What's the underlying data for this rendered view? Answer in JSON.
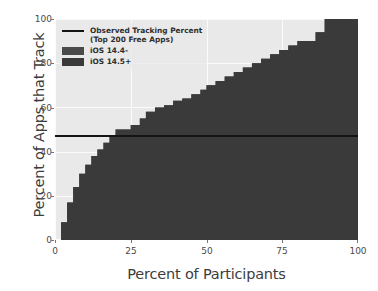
{
  "chart_data": {
    "type": "area",
    "title": "",
    "xlabel": "Percent of Participants",
    "ylabel": "Percent of Apps that Track",
    "xlim": [
      0,
      100
    ],
    "ylim": [
      0,
      100
    ],
    "xticks": [
      "0",
      "25",
      "50",
      "75",
      "100"
    ],
    "yticks": [
      "0",
      "20",
      "40",
      "60",
      "80",
      "100"
    ],
    "grid": true,
    "legend_position": "upper left",
    "annotations": {
      "observed_tracking_percent": 47
    },
    "series": [
      {
        "name": "iOS 14.4-",
        "color": "#4a4a4a",
        "x": [
          0,
          2,
          4,
          6,
          8,
          10,
          12,
          14,
          16,
          18,
          20,
          22,
          25,
          28,
          30,
          33,
          36,
          39,
          42,
          45,
          48,
          50,
          53,
          56,
          59,
          62,
          65,
          68,
          71,
          74,
          77,
          80,
          83,
          86,
          89,
          92,
          95,
          100
        ],
        "values": [
          0,
          8,
          17,
          24,
          30,
          34,
          38,
          41,
          44,
          47,
          50,
          50,
          52,
          55,
          58,
          60,
          61,
          63,
          64,
          66,
          68,
          70,
          72,
          74,
          76,
          78,
          80,
          82,
          84,
          86,
          88,
          90,
          90,
          94,
          100,
          100,
          100,
          100
        ]
      },
      {
        "name": "iOS 14.5+",
        "color": "#3a3a3a",
        "x": [
          0,
          2,
          4,
          6,
          8,
          10,
          12,
          14,
          16,
          18,
          20,
          22,
          25,
          28,
          30,
          33,
          36,
          39,
          42,
          45,
          48,
          50,
          53,
          56,
          59,
          62,
          65,
          68,
          71,
          74,
          77,
          80,
          83,
          86,
          89,
          92,
          95,
          100
        ],
        "values": [
          0,
          8,
          17,
          24,
          30,
          34,
          38,
          41,
          44,
          47,
          50,
          50,
          52,
          55,
          58,
          60,
          61,
          63,
          64,
          66,
          68,
          70,
          72,
          74,
          76,
          78,
          80,
          82,
          84,
          86,
          88,
          90,
          90,
          94,
          100,
          100,
          100,
          100
        ]
      }
    ]
  },
  "legend": {
    "line_label": "Observed Tracking Percent\n(Top 200 Free Apps)",
    "items": [
      {
        "label": "iOS 14.4-",
        "color": "#4a4a4a"
      },
      {
        "label": "iOS 14.5+",
        "color": "#3a3a3a"
      }
    ]
  },
  "colors": {
    "plot_background": "#e9e9e9",
    "grid": "#fbfbfb",
    "figure_background": "#ffffff",
    "reference_line": "#141414",
    "tick_text": "#4a4a4a",
    "axis_label_text": "#3c3c3c"
  }
}
